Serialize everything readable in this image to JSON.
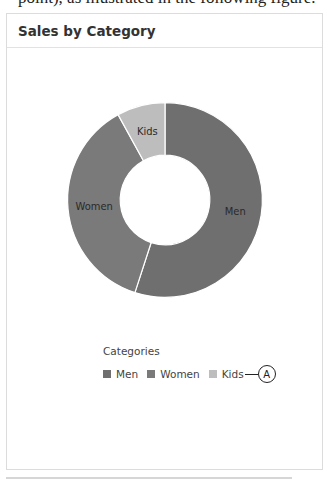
{
  "page": {
    "clipped_caption": "point), as illustrated in the following figure."
  },
  "card": {
    "title": "Sales by Category"
  },
  "legend": {
    "title": "Categories",
    "items": [
      {
        "label": "Men",
        "color": "#6f6f6f"
      },
      {
        "label": "Women",
        "color": "#7a7a7a"
      },
      {
        "label": "Kids",
        "color": "#bdbdbd"
      }
    ],
    "callout_label": "A"
  },
  "chart_data": {
    "type": "pie",
    "subtype": "donut",
    "title": "Sales by Category",
    "legend_title": "Categories",
    "legend_position": "bottom",
    "categories": [
      "Men",
      "Women",
      "Kids"
    ],
    "values": [
      55,
      37,
      8
    ],
    "colors": [
      "#6f6f6f",
      "#7a7a7a",
      "#bdbdbd"
    ],
    "start_angle_deg": 0,
    "direction": "clockwise",
    "inner_radius_ratio": 0.46
  }
}
